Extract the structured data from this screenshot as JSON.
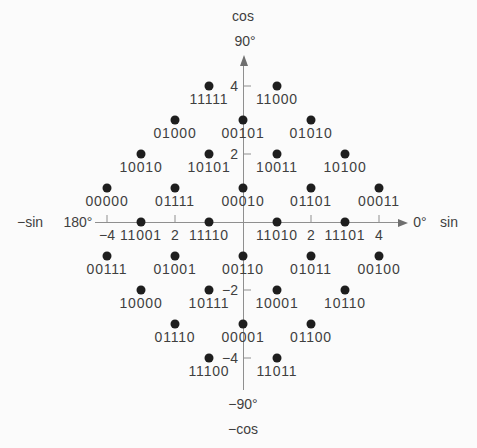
{
  "figure": {
    "background_color": "#fbfbfb",
    "dot_color": "#1e1e1e",
    "axis_color": "#8f8f8f",
    "text_color": "#3f3f3f"
  },
  "chart_data": {
    "type": "scatter",
    "title": "",
    "grid": false,
    "legend": false,
    "axes": {
      "x": {
        "axis_label_positive": "sin",
        "axis_label_negative": "−sin",
        "angle_label_positive": "0°",
        "angle_label_negative": "180°",
        "range": [
          -4.5,
          4.7
        ],
        "ticks": [
          {
            "value": -4,
            "label": "−4"
          },
          {
            "value": -2,
            "label": "2"
          },
          {
            "value": 2,
            "label": "2"
          },
          {
            "value": 4,
            "label": "4"
          }
        ]
      },
      "y": {
        "axis_label_positive": "cos",
        "axis_label_negative": "−cos",
        "angle_label_positive": "90°",
        "angle_label_negative": "−90°",
        "range": [
          -4.9,
          4.8
        ],
        "ticks": [
          {
            "value": 4,
            "label": "4"
          },
          {
            "value": 2,
            "label": "2"
          },
          {
            "value": -2,
            "label": "−2"
          },
          {
            "value": -4,
            "label": "−4"
          }
        ]
      }
    },
    "points": [
      {
        "x": -1,
        "y": 4,
        "label": "11111"
      },
      {
        "x": 1,
        "y": 4,
        "label": "11000"
      },
      {
        "x": -2,
        "y": 3,
        "label": "01000"
      },
      {
        "x": 0,
        "y": 3,
        "label": "00101"
      },
      {
        "x": 2,
        "y": 3,
        "label": "01010"
      },
      {
        "x": -3,
        "y": 2,
        "label": "10010"
      },
      {
        "x": -1,
        "y": 2,
        "label": "10101"
      },
      {
        "x": 1,
        "y": 2,
        "label": "10011"
      },
      {
        "x": 3,
        "y": 2,
        "label": "10100"
      },
      {
        "x": -4,
        "y": 1,
        "label": "00000"
      },
      {
        "x": -2,
        "y": 1,
        "label": "01111"
      },
      {
        "x": 0,
        "y": 1,
        "label": "00010"
      },
      {
        "x": 2,
        "y": 1,
        "label": "01101"
      },
      {
        "x": 4,
        "y": 1,
        "label": "00011"
      },
      {
        "x": -3,
        "y": 0,
        "label": "11001"
      },
      {
        "x": -1,
        "y": 0,
        "label": "11110"
      },
      {
        "x": 1,
        "y": 0,
        "label": "11010"
      },
      {
        "x": 3,
        "y": 0,
        "label": "11101"
      },
      {
        "x": -4,
        "y": -1,
        "label": "00111"
      },
      {
        "x": -2,
        "y": -1,
        "label": "01001"
      },
      {
        "x": 0,
        "y": -1,
        "label": "00110"
      },
      {
        "x": 2,
        "y": -1,
        "label": "01011"
      },
      {
        "x": 4,
        "y": -1,
        "label": "00100"
      },
      {
        "x": -3,
        "y": -2,
        "label": "10000"
      },
      {
        "x": -1,
        "y": -2,
        "label": "10111"
      },
      {
        "x": 1,
        "y": -2,
        "label": "10001"
      },
      {
        "x": 3,
        "y": -2,
        "label": "10110"
      },
      {
        "x": -2,
        "y": -3,
        "label": "01110"
      },
      {
        "x": 0,
        "y": -3,
        "label": "00001"
      },
      {
        "x": 2,
        "y": -3,
        "label": "01100"
      },
      {
        "x": -1,
        "y": -4,
        "label": "11100"
      },
      {
        "x": 1,
        "y": -4,
        "label": "11011"
      }
    ]
  }
}
